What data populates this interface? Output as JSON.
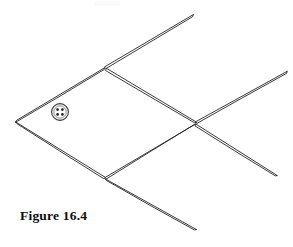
{
  "figure": {
    "caption": "Figure 16.4",
    "background_color": "#ffffff",
    "stroke_color": "#1a1a1a",
    "matchstick_count": 8,
    "vertices": {
      "left_tip": [
        16,
        121
      ],
      "top": [
        105,
        68
      ],
      "bottom": [
        105,
        178
      ],
      "center_right": [
        196,
        123
      ],
      "tail_upper_tip": [
        193,
        15
      ],
      "right_upper_tip": [
        287,
        72
      ],
      "right_lower_tip": [
        277,
        175
      ],
      "tail_lower_tip": [
        196,
        230
      ]
    },
    "matchsticks": [
      {
        "name": "upper-left-body",
        "from": [
          16,
          121
        ],
        "to": [
          105,
          68
        ]
      },
      {
        "name": "lower-left-body",
        "from": [
          16,
          121
        ],
        "to": [
          105,
          178
        ]
      },
      {
        "name": "upper-right-body",
        "from": [
          105,
          68
        ],
        "to": [
          196,
          123
        ]
      },
      {
        "name": "lower-right-body",
        "from": [
          105,
          178
        ],
        "to": [
          196,
          123
        ]
      },
      {
        "name": "upper-tail",
        "from": [
          105,
          68
        ],
        "to": [
          193,
          15
        ]
      },
      {
        "name": "lower-tail",
        "from": [
          105,
          178
        ],
        "to": [
          196,
          230
        ]
      },
      {
        "name": "upper-fin",
        "from": [
          196,
          123
        ],
        "to": [
          287,
          72
        ]
      },
      {
        "name": "lower-fin",
        "from": [
          196,
          123
        ],
        "to": [
          277,
          175
        ]
      }
    ],
    "button": {
      "name": "coin-button",
      "center": [
        60,
        112
      ],
      "radius": 8.5,
      "hole_count": 4,
      "body_color": "#f4f4f4",
      "hole_color": "#222222"
    }
  }
}
